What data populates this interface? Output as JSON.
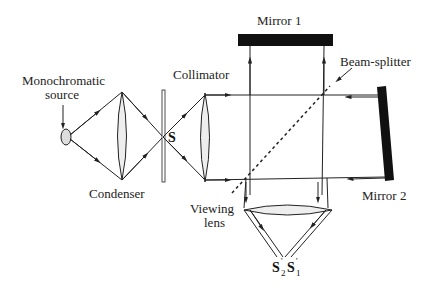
{
  "diagram": {
    "type": "Michelson interferometer",
    "labels": {
      "source": "Monochromatic",
      "source_line2": "source",
      "condenser": "Condenser",
      "collimator": "Collimator",
      "mirror1": "Mirror 1",
      "mirror2": "Mirror 2",
      "beam_splitter": "Beam-splitter",
      "viewing_lens": "Viewing",
      "viewing_lens_line2": "lens",
      "slit": "S",
      "image2": "S",
      "image2_sub": "2",
      "image2_prime": "'",
      "image1": "S",
      "image1_sub": "1",
      "image1_prime": "'"
    },
    "colors": {
      "line": "#222222",
      "mirror": "#111111",
      "lens_fill": "#eeeeee"
    }
  }
}
